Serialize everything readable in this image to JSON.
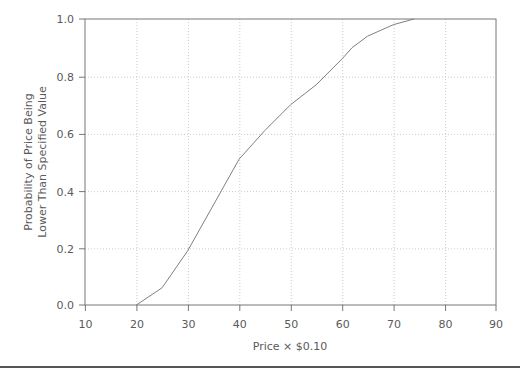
{
  "chart_data": {
    "type": "line",
    "title": "",
    "subtitle": "",
    "xlabel": "Price × $0.10",
    "ylabel": "Probability of Price Being\nLower Than Specified Value",
    "ylabel_line1": "Probability of Price Being",
    "ylabel_line2": "Lower Than Specified Value",
    "xlim": [
      10,
      90
    ],
    "ylim": [
      0.0,
      1.0
    ],
    "xticks": [
      10,
      20,
      30,
      40,
      50,
      60,
      70,
      80,
      90
    ],
    "xtick_labels": [
      "10",
      "20",
      "30",
      "40",
      "50",
      "60",
      "70",
      "80",
      "90"
    ],
    "yticks": [
      0.0,
      0.2,
      0.4,
      0.6,
      0.8,
      1.0
    ],
    "ytick_labels": [
      "0.0",
      "0.2",
      "0.4",
      "0.6",
      "0.8",
      "1.0"
    ],
    "grid": true,
    "grid_style": "dotted",
    "legend": null,
    "series": [
      {
        "name": "Cumulative Distribution",
        "x": [
          20,
          25,
          30,
          35,
          40,
          45,
          50,
          55,
          60,
          62,
          65,
          70,
          74
        ],
        "y": [
          0.0,
          0.06,
          0.19,
          0.35,
          0.51,
          0.61,
          0.7,
          0.77,
          0.86,
          0.9,
          0.94,
          0.98,
          1.0
        ],
        "color": "#808080",
        "line_width": 1
      }
    ],
    "annotations": []
  },
  "axes": {
    "x_axis_name": "price-axis",
    "y_axis_name": "probability-axis"
  },
  "colors": {
    "line": "#808080",
    "frame": "#555555",
    "grid": "#cccccc",
    "text": "#5a5a5a",
    "background": "#ffffff",
    "rule": "#555555"
  }
}
